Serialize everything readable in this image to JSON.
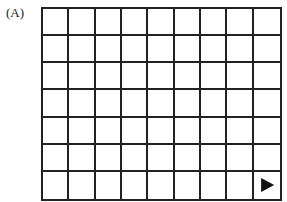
{
  "figure": {
    "label": "(A)",
    "grid": {
      "columns": 9,
      "rows": 7,
      "line_color": "#222222"
    },
    "marker": {
      "type": "right-pointing-triangle",
      "row": 7,
      "column": 9,
      "color": "#111111"
    }
  }
}
